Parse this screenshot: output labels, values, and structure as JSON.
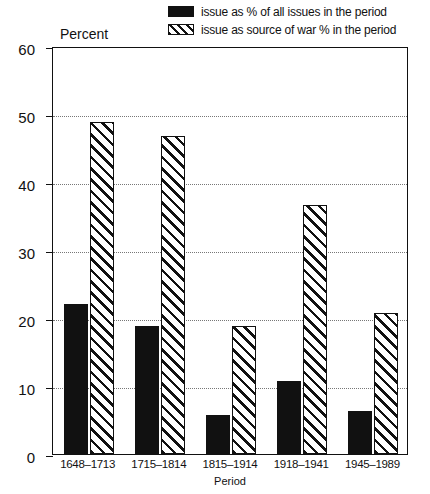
{
  "chart_data": {
    "type": "bar",
    "title": "",
    "xlabel": "Period",
    "ylabel": "Percent",
    "ylim": [
      0,
      60
    ],
    "yticks": [
      0,
      10,
      20,
      30,
      40,
      50,
      60
    ],
    "grid": "horizontal-dotted",
    "legend_position": "top-right",
    "categories": [
      "1648–1713",
      "1715–1814",
      "1815–1914",
      "1918–1941",
      "1945–1989"
    ],
    "series": [
      {
        "name": "issue as % of all issues in the period",
        "swatch": "solid",
        "color": "#111111",
        "values": [
          22.0,
          18.8,
          5.7,
          10.8,
          6.3
        ]
      },
      {
        "name": "issue as source of war % in the period",
        "swatch": "hatch",
        "color": "#111111",
        "values": [
          48.8,
          46.7,
          18.8,
          36.6,
          20.7
        ]
      }
    ]
  },
  "legend": {
    "items": [
      {
        "label": "issue as % of all issues in the period",
        "style": "solid"
      },
      {
        "label": "issue as source of war % in the period",
        "style": "hatch"
      }
    ]
  },
  "axes": {
    "y_title": "Percent",
    "x_title": "Period",
    "y_tick_labels": [
      "0",
      "10",
      "20",
      "30",
      "40",
      "50",
      "60"
    ]
  }
}
